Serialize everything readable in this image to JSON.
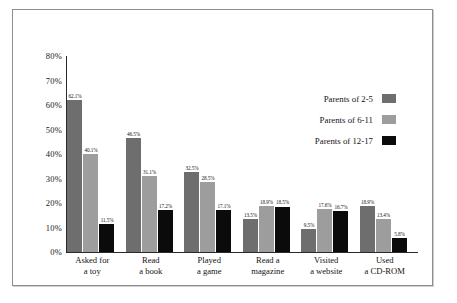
{
  "chart_data": {
    "type": "bar",
    "title": "",
    "subtitle": "",
    "xlabel": "",
    "ylabel": "",
    "ylim": [
      0,
      80
    ],
    "grid": false,
    "legend_position": "upper-right-inside",
    "ytick_labels": [
      "80%",
      "70%",
      "60%",
      "50%",
      "40%",
      "30%",
      "20%",
      "10%",
      "0%"
    ],
    "ytick_values": [
      80,
      70,
      60,
      50,
      40,
      30,
      20,
      10,
      0
    ],
    "categories": [
      "Asked for a toy",
      "Read a book",
      "Played a game",
      "Read a magazine",
      "Visited a website",
      "Used a CD-ROM"
    ],
    "category_lines": [
      [
        "Asked for",
        "a toy"
      ],
      [
        "Read",
        "a book"
      ],
      [
        "Played",
        "a game"
      ],
      [
        "Read a",
        "magazine"
      ],
      [
        "Visited",
        "a website"
      ],
      [
        "Used",
        "a CD-ROM"
      ]
    ],
    "series": [
      {
        "name": "Parents of 2-5",
        "color": "#6e6e6e",
        "values": [
          62.1,
          46.5,
          32.5,
          13.5,
          9.5,
          18.9
        ],
        "labels": [
          "62.1%",
          "46.5%",
          "32.5%",
          "13.5%",
          "9.5%",
          "18.9%"
        ]
      },
      {
        "name": "Parents of 6-11",
        "color": "#9d9d9d",
        "values": [
          40.1,
          31.1,
          28.5,
          18.9,
          17.6,
          13.4
        ],
        "labels": [
          "40.1%",
          "31.1%",
          "28.5%",
          "18.9%",
          "17.6%",
          "13.4%"
        ]
      },
      {
        "name": "Parents of 12-17",
        "color": "#0b0b0b",
        "values": [
          11.5,
          17.2,
          17.1,
          18.5,
          16.7,
          5.8
        ],
        "labels": [
          "11.5%",
          "17.2%",
          "17.1%",
          "18.5%",
          "16.7%",
          "5.8%"
        ]
      }
    ]
  }
}
